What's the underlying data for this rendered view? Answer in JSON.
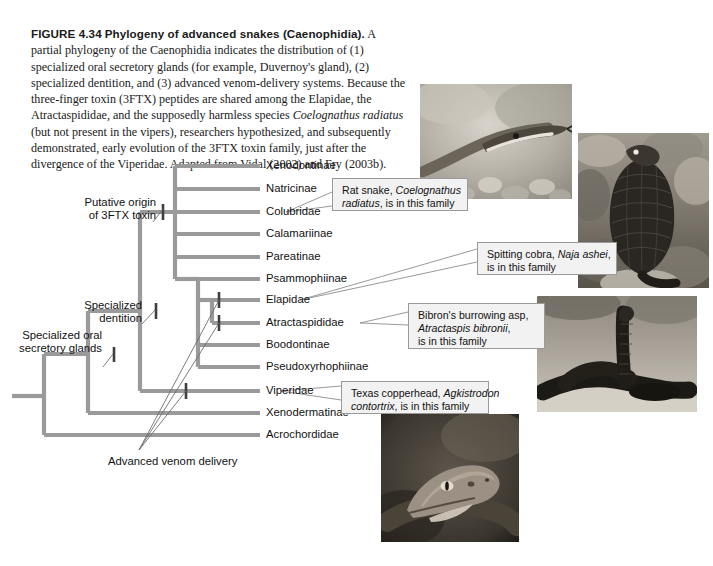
{
  "figure": {
    "label": "FIGURE 4.34",
    "title": "Phylogeny of advanced snakes (Caenophidia).",
    "caption_body": " A partial phylogeny of the Caenophidia indicates the distribution of (1) specialized oral secretory glands (for example, Duvernoy's gland), (2) specialized dentition, and (3) advanced venom-delivery systems. Because the three-finger toxin (3FTX) peptides are shared among the Elapidae, the Atractaspididae, and the supposedly harmless species ",
    "caption_species": "Coelognathus radiatus",
    "caption_tail": " (but not present in the vipers), researchers hypothesized, and subsequently demonstrated, early evolution of the 3FTX toxin family, just after the divergence of the Viperidae. Adapted from Vidal (2002) and Fry (2003b)."
  },
  "tree": {
    "taxa": [
      {
        "name": "Xenodontinae",
        "y": 166
      },
      {
        "name": "Natricinae",
        "y": 189
      },
      {
        "name": "Colubridae",
        "y": 212
      },
      {
        "name": "Calamariinae",
        "y": 234
      },
      {
        "name": "Pareatinae",
        "y": 257
      },
      {
        "name": "Psammophiinae",
        "y": 279
      },
      {
        "name": "Elapidae",
        "y": 300
      },
      {
        "name": "Atractaspididae",
        "y": 323
      },
      {
        "name": "Boodontinae",
        "y": 345
      },
      {
        "name": "Pseudoxyrhophiinae",
        "y": 367
      },
      {
        "name": "Viperidae",
        "y": 391
      },
      {
        "name": "Xenodermatinae",
        "y": 413
      },
      {
        "name": "Acrochordidae",
        "y": 435
      }
    ],
    "annotations": [
      {
        "id": "putative-origin",
        "text_line1": "Putative origin",
        "text_line2": "of 3FTX toxin"
      },
      {
        "id": "specialized-dentition",
        "text_line1": "Specialized",
        "text_line2": "dentition"
      },
      {
        "id": "specialized-oral-glands",
        "text_line1": "Specialized oral",
        "text_line2": "secretory glands"
      },
      {
        "id": "advanced-venom-delivery",
        "text_line1": "Advanced venom delivery",
        "text_line2": ""
      }
    ],
    "branch_color": "#9a9a9a",
    "tick_color": "#4a4a4a",
    "leader_color": "#6e6e6e"
  },
  "callouts": [
    {
      "id": "rat-snake",
      "pre": "Rat snake, ",
      "species": "Coelognathus",
      "line2_species": "radiatus",
      "post": ", is in this family",
      "full_line1": "Rat snake, Coelognathus",
      "full_line2": "radiatus, is in this family"
    },
    {
      "id": "spitting-cobra",
      "pre": "Spitting cobra, ",
      "species": "Naja ashei",
      "post": ",",
      "line2": "is in this family"
    },
    {
      "id": "burrowing-asp",
      "line1": "Bibron's burrowing asp,",
      "species": "Atractaspis bibronii",
      "post": ",",
      "line3": "is in this family"
    },
    {
      "id": "texas-copperhead",
      "pre": "Texas copperhead, ",
      "species": "Agkistrodon",
      "line2_species": "contortrix",
      "post": ", is in this family"
    }
  ],
  "photos": [
    {
      "id": "rat-snake-photo",
      "alt": "rat-snake-photograph"
    },
    {
      "id": "spitting-cobra-photo",
      "alt": "spitting-cobra-photograph"
    },
    {
      "id": "burrowing-asp-photo",
      "alt": "burrowing-asp-photograph"
    },
    {
      "id": "copperhead-photo",
      "alt": "copperhead-photograph"
    }
  ]
}
